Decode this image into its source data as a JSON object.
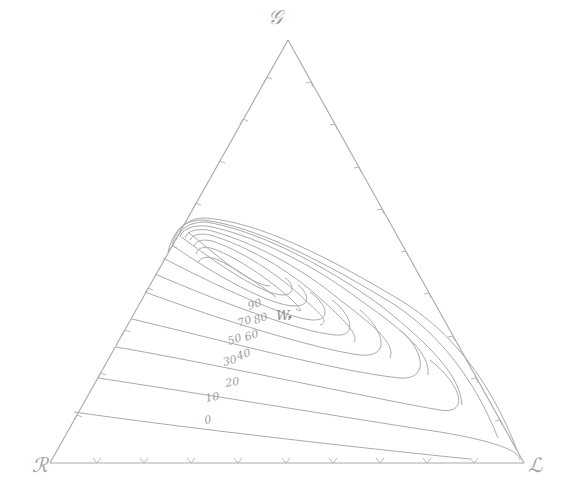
{
  "diagram": {
    "type": "ternary-contour",
    "vertices": {
      "top": "𝒢",
      "bottom_left": "ℛ",
      "bottom_right": "ℒ"
    },
    "point": {
      "label": "W."
    },
    "contour_labels": [
      "0",
      "10",
      "20",
      "30",
      "40",
      "50",
      "60",
      "70",
      "80",
      "90"
    ],
    "colors": {
      "line": "#aaaaaa",
      "text": "#9a9a9a",
      "background": "#ffffff"
    }
  }
}
